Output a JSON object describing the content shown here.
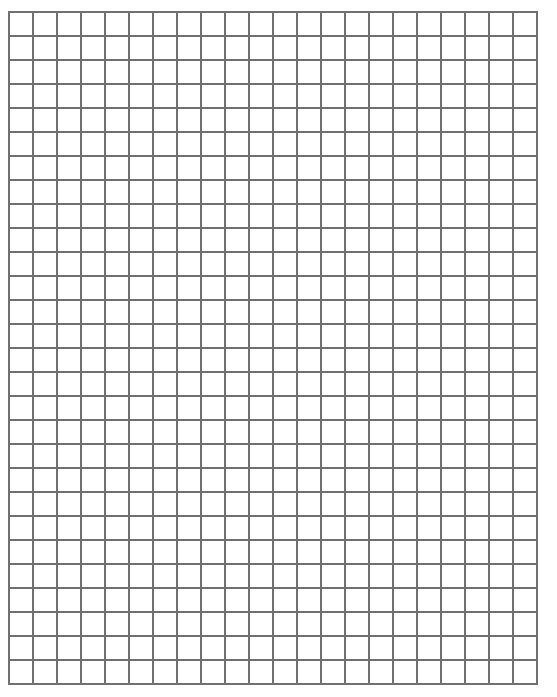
{
  "page": {
    "background": "#ffffff"
  },
  "grid": {
    "left": 8,
    "top": 11,
    "columns": 22,
    "rows": 28,
    "cell_size": 24,
    "line_color": "#707070",
    "line_width": 2
  }
}
